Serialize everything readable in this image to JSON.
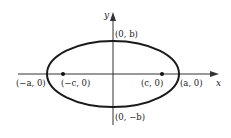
{
  "diagram": {
    "type": "ellipse-with-foci",
    "axes": {
      "x_label": "x",
      "y_label": "y"
    },
    "ellipse": {
      "center": [
        113,
        74
      ],
      "rx": 66,
      "ry": 33,
      "stroke": "#1a1a1a"
    },
    "points": {
      "left_vertex": "(−a, 0)",
      "right_vertex": "(a, 0)",
      "left_focus": "(−c, 0)",
      "right_focus": "(c, 0)",
      "top_covertex": "(0, b)",
      "bottom_covertex": "(0, −b)"
    }
  }
}
